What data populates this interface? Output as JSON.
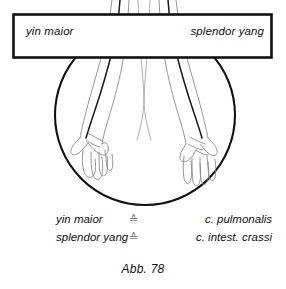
{
  "figure": {
    "caption": "Abb. 78",
    "box": {
      "left_label": "yin maior",
      "right_label": "splendor yang"
    },
    "illustration": {
      "description": "line drawing of two forearms and hands hanging down inside a circle",
      "circle_name": "body-region-circle"
    }
  },
  "legend": {
    "rows": [
      {
        "term": "yin maior",
        "symbol": "≙",
        "equivalent": "c. pulmonalis"
      },
      {
        "term": "splendor yang",
        "symbol": "≙",
        "equivalent": "c. intest. crassi"
      }
    ]
  },
  "colors": {
    "ink": "#111111",
    "line_light": "#8a8a8a",
    "symbol": "#777777",
    "background": "#ffffff"
  }
}
